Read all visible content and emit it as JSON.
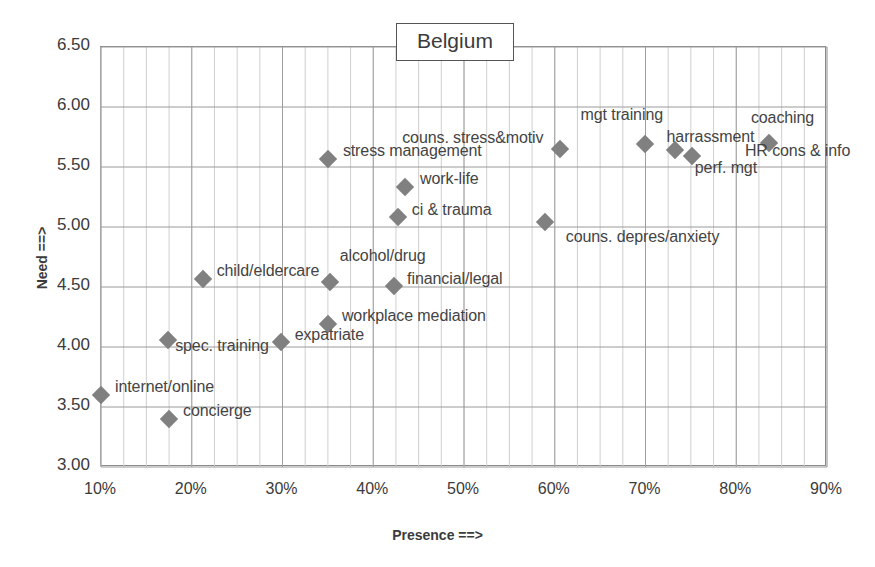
{
  "chart_data": {
    "type": "scatter",
    "title": "Belgium",
    "xlabel": "Presence ==>",
    "ylabel": "Need ==>",
    "xlim": [
      10,
      90
    ],
    "ylim": [
      3.0,
      6.5
    ],
    "xtick_labels": [
      "10%",
      "20%",
      "30%",
      "40%",
      "50%",
      "60%",
      "70%",
      "80%",
      "90%"
    ],
    "xticks": [
      10,
      20,
      30,
      40,
      50,
      60,
      70,
      80,
      90
    ],
    "ytick_labels": [
      "3.00",
      "3.50",
      "4.00",
      "4.50",
      "5.00",
      "5.50",
      "6.00",
      "6.50"
    ],
    "yticks": [
      3.0,
      3.5,
      4.0,
      4.5,
      5.0,
      5.5,
      6.0,
      6.5
    ],
    "grid": true,
    "minor_grid_x": true,
    "legend": "none",
    "marker_color": "#808080",
    "marker_shape": "diamond",
    "points": [
      {
        "label": "internet/online",
        "x": 10.0,
        "y": 3.6,
        "label_dx": 14,
        "label_dy": -9
      },
      {
        "label": "concierge",
        "x": 17.5,
        "y": 3.4,
        "label_dx": 14,
        "label_dy": -9
      },
      {
        "label": "spec. training",
        "x": 17.4,
        "y": 4.06,
        "label_dx": 7,
        "label_dy": 5
      },
      {
        "label": "child/eldercare",
        "x": 21.2,
        "y": 4.57,
        "label_dx": 14,
        "label_dy": -9
      },
      {
        "label": "expatriate",
        "x": 29.8,
        "y": 4.04,
        "label_dx": 14,
        "label_dy": -8
      },
      {
        "label": "workplace mediation",
        "x": 35.0,
        "y": 4.19,
        "label_dx": 14,
        "label_dy": -9
      },
      {
        "label": "alcohol/drug",
        "x": 35.2,
        "y": 4.54,
        "label_dx": 10,
        "label_dy": -27
      },
      {
        "label": "financial/legal",
        "x": 42.3,
        "y": 4.51,
        "label_dx": 13,
        "label_dy": -8
      },
      {
        "label": "ci & trauma",
        "x": 42.7,
        "y": 5.08,
        "label_dx": 14,
        "label_dy": -8
      },
      {
        "label": "work-life",
        "x": 43.5,
        "y": 5.33,
        "label_dx": 15,
        "label_dy": -9
      },
      {
        "label": "stress management",
        "x": 35.0,
        "y": 5.57,
        "label_dx": 15,
        "label_dy": -9
      },
      {
        "label": "couns. depres/anxiety",
        "x": 58.9,
        "y": 5.04,
        "label_dx": 21,
        "label_dy": 14
      },
      {
        "label": "couns. stress&motiv",
        "x": 60.6,
        "y": 5.65,
        "label_dx": -158,
        "label_dy": -12
      },
      {
        "label": "mgt training",
        "x": 69.9,
        "y": 5.69,
        "label_dx": -64,
        "label_dy": -30
      },
      {
        "label": "harrassment",
        "x": 73.2,
        "y": 5.64,
        "label_dx": -8,
        "label_dy": -14
      },
      {
        "label": "perf. mgt",
        "x": 75.1,
        "y": 5.59,
        "label_dx": 3,
        "label_dy": 11
      },
      {
        "label": "coaching",
        "x": 83.6,
        "y": 5.7,
        "label_dx": -18,
        "label_dy": -26
      },
      {
        "label": "HR cons & info",
        "x": 83.6,
        "y": 5.7,
        "label_dx": -24,
        "label_dy": 7
      }
    ]
  },
  "axes": {
    "y_title": "Need ==>",
    "x_title": "Presence ==>"
  },
  "title_box": {
    "text": "Belgium"
  }
}
